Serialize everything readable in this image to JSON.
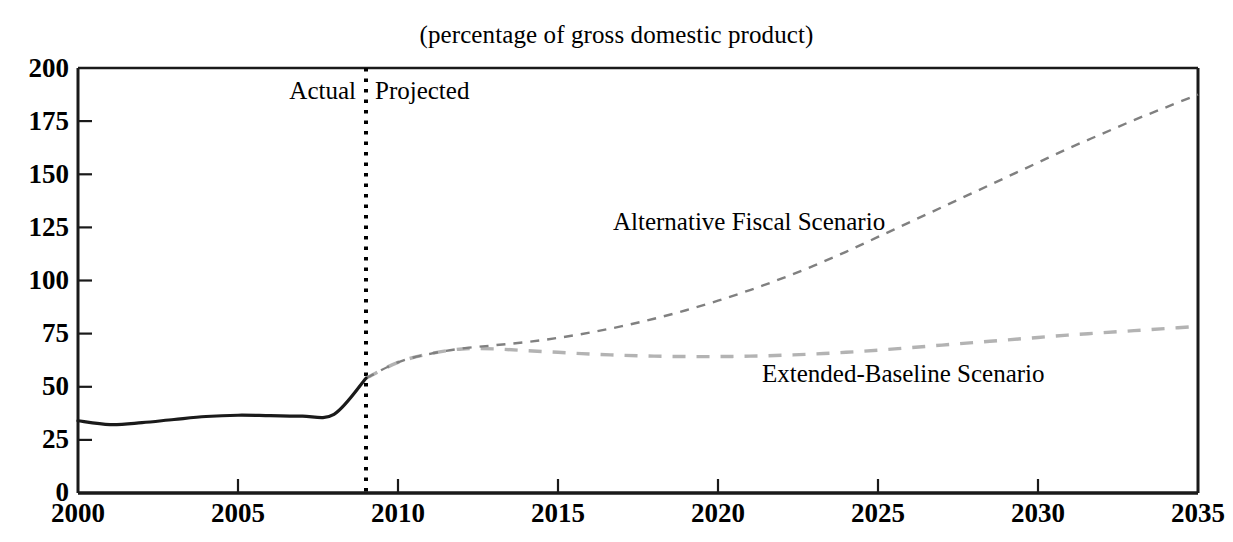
{
  "chart_data": {
    "type": "line",
    "title": "(percentage of gross domestic product)",
    "subtitle": "",
    "xlabel": "",
    "ylabel": "",
    "xlim": [
      2000,
      2035
    ],
    "ylim": [
      0,
      200
    ],
    "xticks": [
      2000,
      2005,
      2010,
      2015,
      2020,
      2025,
      2030,
      2035
    ],
    "xtick_labels": [
      "2000",
      "2005",
      "2010",
      "2015",
      "2020",
      "2025",
      "2030",
      "2035"
    ],
    "yticks": [
      0,
      25,
      50,
      75,
      100,
      125,
      150,
      175,
      200
    ],
    "ytick_labels": [
      "0",
      "25",
      "50",
      "75",
      "100",
      "125",
      "150",
      "175",
      "200"
    ],
    "grid": false,
    "legend_position": "inline-annotation",
    "annotations": [
      {
        "name": "actual-label",
        "text": "Actual",
        "x": 2008.6,
        "y": 190,
        "align": "right"
      },
      {
        "name": "projected-label",
        "text": "Projected",
        "x": 2009.4,
        "y": 190,
        "align": "left"
      },
      {
        "name": "alternative-fiscal-scenario-label",
        "text": "Alternative Fiscal Scenario",
        "x": 2017.0,
        "y": 128,
        "align": "left"
      },
      {
        "name": "extended-baseline-scenario-label",
        "text": "Extended-Baseline Scenario",
        "x": 2021.5,
        "y": 57,
        "align": "left"
      }
    ],
    "divider": {
      "name": "actual-projected-divider",
      "x": 2009,
      "style": "dotted",
      "color": "#000000"
    },
    "series": [
      {
        "name": "Actual",
        "style": "solid",
        "color": "#1a1a1a",
        "width": 3,
        "x": [
          2000,
          2001,
          2002,
          2003,
          2004,
          2005,
          2006,
          2007,
          2008,
          2009
        ],
        "values": [
          34.0,
          32.2,
          33.1,
          34.6,
          36.0,
          36.6,
          36.4,
          36.2,
          37.0,
          54.0
        ]
      },
      {
        "name": "Alternative Fiscal Scenario",
        "style": "dashed",
        "color": "#808080",
        "width": 2,
        "x": [
          2009,
          2010,
          2011,
          2012,
          2013,
          2014,
          2015,
          2016,
          2017,
          2018,
          2019,
          2020,
          2021,
          2022,
          2023,
          2024,
          2025,
          2026,
          2027,
          2028,
          2029,
          2030,
          2031,
          2032,
          2033,
          2034,
          2035
        ],
        "values": [
          54.0,
          61.5,
          65.5,
          68.0,
          69.5,
          71.0,
          73.0,
          75.5,
          78.5,
          82.0,
          86.0,
          90.5,
          95.5,
          101.0,
          107.0,
          113.5,
          120.5,
          127.5,
          134.5,
          141.5,
          148.5,
          155.5,
          162.5,
          169.0,
          175.5,
          181.5,
          187.5
        ]
      },
      {
        "name": "Extended-Baseline Scenario",
        "style": "dashed",
        "color": "#b3b3b3",
        "width": 3,
        "x": [
          2009,
          2010,
          2011,
          2012,
          2013,
          2014,
          2015,
          2016,
          2017,
          2018,
          2019,
          2020,
          2021,
          2022,
          2023,
          2024,
          2025,
          2026,
          2027,
          2028,
          2029,
          2030,
          2031,
          2032,
          2033,
          2034,
          2035
        ],
        "values": [
          54.0,
          61.5,
          65.5,
          67.8,
          67.8,
          67.0,
          66.2,
          65.4,
          64.8,
          64.4,
          64.2,
          64.2,
          64.4,
          64.8,
          65.4,
          66.2,
          67.2,
          68.4,
          69.6,
          70.8,
          72.0,
          73.2,
          74.4,
          75.4,
          76.4,
          77.4,
          78.4
        ]
      }
    ]
  },
  "axes": {
    "y_labels": [
      "200",
      "175",
      "150",
      "125",
      "100",
      "75",
      "50",
      "25",
      "0"
    ],
    "x_labels": [
      "2000",
      "2005",
      "2010",
      "2015",
      "2020",
      "2025",
      "2030",
      "2035"
    ]
  },
  "labels": {
    "title": "(percentage of gross domestic product)",
    "actual": "Actual",
    "projected": "Projected",
    "alternative_fiscal_scenario": "Alternative Fiscal Scenario",
    "extended_baseline_scenario": "Extended-Baseline Scenario"
  },
  "colors": {
    "axis": "#1a1a1a",
    "actual_line": "#1a1a1a",
    "alternative_line": "#808080",
    "extended_line": "#b3b3b3",
    "divider": "#000000",
    "background": "#ffffff"
  }
}
